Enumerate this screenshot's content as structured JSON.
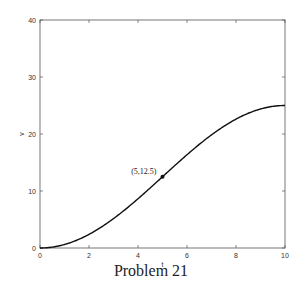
{
  "chart_data": {
    "type": "line",
    "title": "",
    "xlabel": "t",
    "ylabel": "v",
    "xlim": [
      0,
      10
    ],
    "ylim": [
      0,
      40
    ],
    "xticks": [
      0,
      2,
      4,
      6,
      8,
      10
    ],
    "yticks": [
      0,
      10,
      20,
      30,
      40
    ],
    "grid": false,
    "series": [
      {
        "name": "v(t)",
        "x": [
          0,
          0.5,
          1,
          1.5,
          2,
          2.5,
          3,
          3.5,
          4,
          4.5,
          5,
          5.5,
          6,
          6.5,
          7,
          7.5,
          8,
          8.5,
          9,
          9.5,
          10
        ],
        "y": [
          0,
          0.31,
          1.22,
          2.7,
          4.69,
          7.13,
          9.93,
          12.5,
          13.04,
          15.95,
          12.5,
          15.0,
          16.37,
          18.19,
          19.85,
          21.34,
          22.61,
          23.65,
          24.39,
          24.85,
          25
        ]
      }
    ],
    "annotations": [
      {
        "label": "(5,12.5)",
        "x": 5,
        "y": 12.5
      }
    ]
  },
  "caption": "Problem 21"
}
